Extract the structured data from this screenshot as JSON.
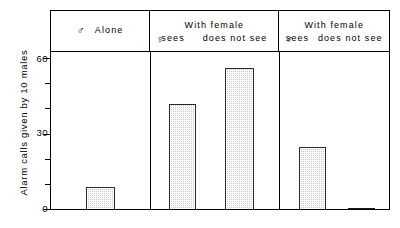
{
  "chart_data": {
    "type": "bar",
    "title": "",
    "xlabel": "",
    "ylabel": "Alarm calls given by 10 males",
    "ylim": [
      0,
      70
    ],
    "grid": false,
    "legend": "none",
    "y_ticks_major": [
      0,
      30,
      60
    ],
    "y_ticks_minor": [
      10,
      20,
      40,
      50,
      70
    ],
    "y_tick_labels": [
      "0",
      "30",
      "60"
    ],
    "categories": [
      "Alone",
      "With female, female sees",
      "With female, female does not see",
      "With female, male sees",
      "With female, male does not see"
    ],
    "values": [
      10,
      47,
      63,
      28,
      1
    ],
    "panels": [
      {
        "id": "panel-alone",
        "symbol": "♂",
        "title_line1": "",
        "title_line2": "Alone",
        "single_label": true,
        "bars": [
          {
            "label": "Alone",
            "value": 10
          }
        ]
      },
      {
        "id": "panel-female-observer",
        "symbol": "♀",
        "title_line1": "With  female",
        "sub_left": "sees",
        "sub_right": "does not see",
        "single_label": false,
        "bars": [
          {
            "label": "sees",
            "value": 47
          },
          {
            "label": "does not see",
            "value": 63
          }
        ]
      },
      {
        "id": "panel-male-observer",
        "symbol": "♂",
        "title_line1": "With  female",
        "sub_left": "sees",
        "sub_right": "does not see",
        "single_label": false,
        "bars": [
          {
            "label": "sees",
            "value": 28
          },
          {
            "label": "does not see",
            "value": 1
          }
        ]
      }
    ]
  }
}
